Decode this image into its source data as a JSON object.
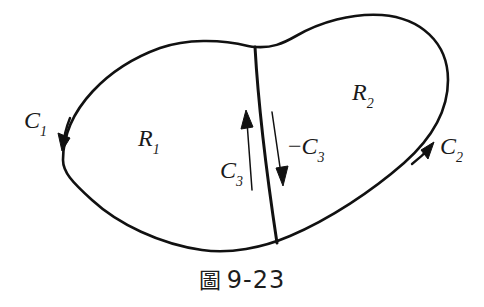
{
  "figure": {
    "caption_cjk": "圖",
    "caption_number": "9-23",
    "background_color": "#ffffff",
    "stroke_color": "#111111"
  },
  "labels": {
    "c1": {
      "base": "C",
      "sub": "1",
      "sign": ""
    },
    "c2": {
      "base": "C",
      "sub": "2",
      "sign": ""
    },
    "c3": {
      "base": "C",
      "sub": "3",
      "sign": ""
    },
    "neg_c3": {
      "base": "C",
      "sub": "3",
      "sign": "−"
    },
    "r1": {
      "base": "R",
      "sub": "1",
      "sign": ""
    },
    "r2": {
      "base": "R",
      "sub": "2",
      "sign": ""
    }
  },
  "diagram_data": {
    "type": "diagram",
    "description": "Closed bean-shaped region divided by an internal curve into two subregions",
    "regions": [
      {
        "name": "R1",
        "position": "left"
      },
      {
        "name": "R2",
        "position": "right"
      }
    ],
    "curves": [
      {
        "name": "C1",
        "role": "left boundary arc",
        "direction": "downward",
        "arrow_at": [
          66,
          141
        ]
      },
      {
        "name": "C2",
        "role": "right boundary arc",
        "direction": "upward-right",
        "arrow_at": [
          425,
          150
        ]
      },
      {
        "name": "C3",
        "role": "dividing segment traversed upward",
        "direction": "up",
        "arrow_at": [
          246,
          113
        ]
      },
      {
        "name": "-C3",
        "role": "dividing segment traversed downward",
        "direction": "down",
        "arrow_at": [
          283,
          183
        ]
      }
    ],
    "divider": {
      "top": [
        255,
        47
      ],
      "bottom": [
        277,
        243
      ]
    }
  }
}
